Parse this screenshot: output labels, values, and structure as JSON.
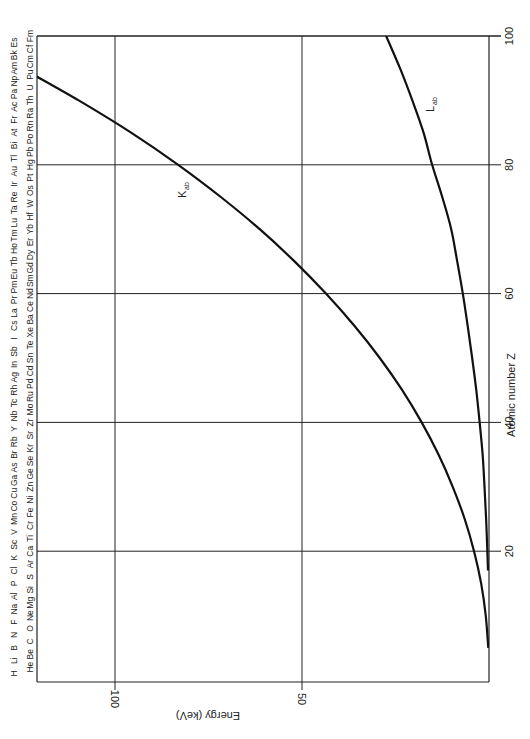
{
  "chart_data": {
    "type": "line",
    "title": "",
    "orientation": "rotated 90 degrees (atomic number vertical on right, energy horizontal decreasing to the right)",
    "xlabel": "Atomic number Z",
    "ylabel": "Energy (keV)",
    "x_ticks": [
      20,
      40,
      60,
      80,
      100
    ],
    "y_ticks": [
      50,
      100
    ],
    "xlim": [
      0,
      100
    ],
    "ylim": [
      0,
      120
    ],
    "grid": true,
    "series": [
      {
        "name": "K_ab",
        "label": "K",
        "subscript": "ab",
        "x": [
          5,
          10,
          15,
          20,
          25,
          30,
          35,
          40,
          45,
          50,
          55,
          60,
          65,
          70,
          75,
          80,
          85,
          90,
          94
        ],
        "values": [
          0.19,
          0.87,
          2.1,
          4.0,
          6.5,
          9.7,
          13.5,
          18.0,
          23.2,
          29.2,
          36.0,
          43.6,
          52.0,
          61.3,
          71.7,
          83.1,
          95.7,
          109.7,
          121.8
        ]
      },
      {
        "name": "L_ab",
        "label": "L",
        "subscript": "ab",
        "x": [
          17,
          20,
          25,
          30,
          35,
          40,
          45,
          50,
          55,
          60,
          65,
          70,
          75,
          80,
          85,
          90,
          95,
          100
        ],
        "values": [
          0.27,
          0.44,
          0.77,
          1.2,
          1.7,
          2.5,
          3.4,
          4.5,
          5.7,
          7.0,
          8.5,
          10.1,
          12.5,
          15.2,
          17.5,
          20.5,
          23.8,
          27.5
        ]
      }
    ],
    "element_labels": {
      "odd_row": [
        "H",
        "Li",
        "B",
        "N",
        "F",
        "Na",
        "Al",
        "P",
        "Cl",
        "K",
        "Sc",
        "V",
        "Mn",
        "Co",
        "Cu",
        "Ga",
        "As",
        "Br",
        "Rb",
        "Y",
        "Nb",
        "Tc",
        "Rh",
        "Ag",
        "In",
        "Sb",
        "I",
        "Cs",
        "La",
        "Pr",
        "Pm",
        "Eu",
        "Tb",
        "Ho",
        "Tm",
        "Lu",
        "Ta",
        "Re",
        "Ir",
        "Au",
        "Tl",
        "Bi",
        "At",
        "Fr",
        "Ac",
        "Pa",
        "Np",
        "Am",
        "Bk",
        "Es"
      ],
      "even_row": [
        "He",
        "Be",
        "C",
        "O",
        "Ne",
        "Mg",
        "Si",
        "S",
        "Ar",
        "Ca",
        "Ti",
        "Cr",
        "Fe",
        "Ni",
        "Zn",
        "Ge",
        "Se",
        "Kr",
        "Sr",
        "Zr",
        "Mo",
        "Ru",
        "Pd",
        "Cd",
        "Sn",
        "Te",
        "Xe",
        "Ba",
        "Ce",
        "Nd",
        "Sm",
        "Gd",
        "Dy",
        "Er",
        "Yb",
        "Hf",
        "W",
        "Os",
        "Pt",
        "Hg",
        "Pb",
        "Po",
        "Rn",
        "Ra",
        "Th",
        "U",
        "Pu",
        "Cm",
        "Cf",
        "Fm"
      ]
    }
  },
  "labels": {
    "z_axis_title": "Atomic number Z",
    "energy_axis_title": "Energy (keV)",
    "k_curve_main": "K",
    "k_curve_sub": "ab",
    "l_curve_main": "L",
    "l_curve_sub": "ab"
  }
}
